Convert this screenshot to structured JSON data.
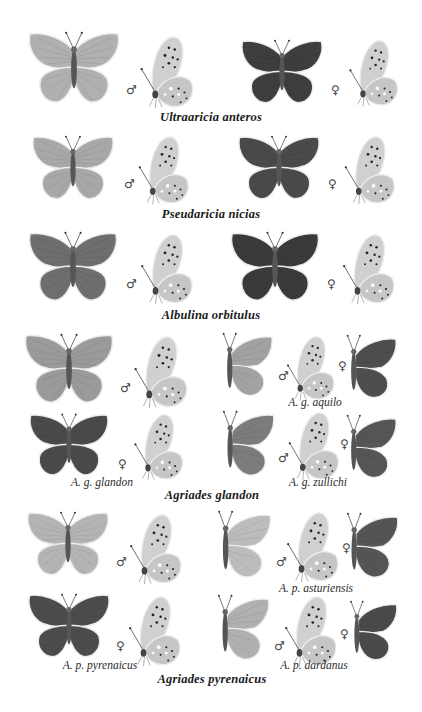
{
  "plate": {
    "background": "#ffffff",
    "palette": {
      "male_upper": "#a9a9a9",
      "female_upper": "#4a4a4a",
      "under": "#cfcfcf",
      "outline": "#efefef",
      "spot": "#222222",
      "vein": "#7a7a7a"
    },
    "symbols": {
      "male": "♂",
      "female": "♀"
    },
    "species": [
      {
        "name": "Ultraaricia anteros",
        "figures": [
          {
            "view": "upperside",
            "sex": "male"
          },
          {
            "view": "underside",
            "sex": "male"
          },
          {
            "view": "upperside",
            "sex": "female"
          },
          {
            "view": "underside",
            "sex": "female"
          }
        ]
      },
      {
        "name": "Pseudaricia nicias",
        "figures": [
          {
            "view": "upperside",
            "sex": "male"
          },
          {
            "view": "underside",
            "sex": "male"
          },
          {
            "view": "upperside",
            "sex": "female"
          },
          {
            "view": "underside",
            "sex": "female"
          }
        ]
      },
      {
        "name": "Albulina orbitulus",
        "figures": [
          {
            "view": "upperside",
            "sex": "male"
          },
          {
            "view": "underside",
            "sex": "male"
          },
          {
            "view": "upperside",
            "sex": "female"
          },
          {
            "view": "underside",
            "sex": "female"
          }
        ]
      },
      {
        "name": "Agriades glandon",
        "subspecies": [
          {
            "name": "A. g. glandon",
            "figures": [
              "male upperside",
              "male underside",
              "female upperside",
              "female underside"
            ]
          },
          {
            "name": "A. g. aquilo",
            "figures": [
              "male upperside",
              "male underside",
              "female upperside"
            ]
          },
          {
            "name": "A. g. zullichi",
            "figures": [
              "male upperside",
              "male underside",
              "female upperside"
            ]
          }
        ]
      },
      {
        "name": "Agriades pyrenaicus",
        "subspecies": [
          {
            "name": "A. p. pyrenaicus",
            "figures": [
              "male upperside",
              "male underside",
              "female upperside",
              "female underside"
            ]
          },
          {
            "name": "A. p. asturiensis",
            "figures": [
              "male upperside",
              "male underside",
              "female upperside"
            ]
          },
          {
            "name": "A. p. dardanus",
            "figures": [
              "male upperside",
              "male underside",
              "female upperside"
            ]
          }
        ]
      }
    ],
    "captions": {
      "anteros": "Ultraaricia anteros",
      "nicias": "Pseudaricia nicias",
      "orbitulus": "Albulina orbitulus",
      "glandon": "Agriades glandon",
      "glandon_glandon": "A. g. glandon",
      "glandon_aquilo": "A. g. aquilo",
      "glandon_zullichi": "A. g. zullichi",
      "pyrenaicus": "Agriades pyrenaicus",
      "pyrenaicus_pyrenaicus": "A. p. pyrenaicus",
      "pyrenaicus_asturiensis": "A. p. asturiensis",
      "pyrenaicus_dardanus": "A. p. dardanus"
    }
  }
}
